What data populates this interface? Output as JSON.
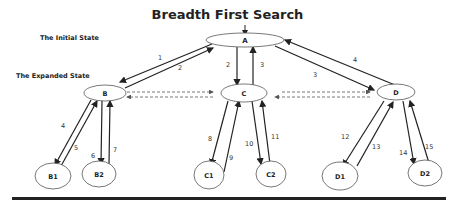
{
  "title": "Breadth First Search",
  "labels": {
    "initial_state": "The Initial State",
    "expanded_state": "The Expanded State"
  },
  "nodes": {
    "A": "A",
    "B": "B",
    "C": "C",
    "D": "D",
    "B1": "B1",
    "B2": "B2",
    "C1": "C1",
    "C2": "C2",
    "D1": "D1",
    "D2": "D2"
  },
  "edge_labels": {
    "e1": "1",
    "e2a": "2",
    "e2b": "2",
    "e3a": "3",
    "e3b": "3",
    "e4a": "4",
    "e4b": "4",
    "e5": "5",
    "e6": "6",
    "e7": "7",
    "e8": "8",
    "e9": "9",
    "e10": "10",
    "e11": "11",
    "e12": "12",
    "e13": "13",
    "e14": "14",
    "e15": "15"
  },
  "colors": {
    "line": "#222222",
    "dashed": "#555555",
    "baseline": "#222222"
  }
}
